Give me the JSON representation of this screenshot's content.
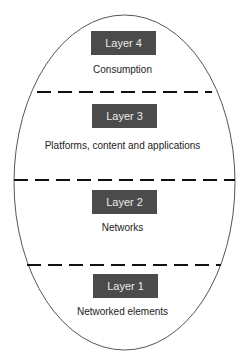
{
  "diagram": {
    "shape": "ellipse",
    "colors": {
      "box_fill": "#4b4b4b",
      "box_text": "#ececec",
      "caption_text": "#222222",
      "outline": "#555555",
      "dash": "#111111"
    },
    "layers": [
      {
        "label": "Layer 4",
        "caption": "Consumption"
      },
      {
        "label": "Layer 3",
        "caption": "Platforms, content and applications"
      },
      {
        "label": "Layer 2",
        "caption": "Networks"
      },
      {
        "label": "Layer 1",
        "caption": "Networked elements"
      }
    ],
    "separators": 3
  }
}
